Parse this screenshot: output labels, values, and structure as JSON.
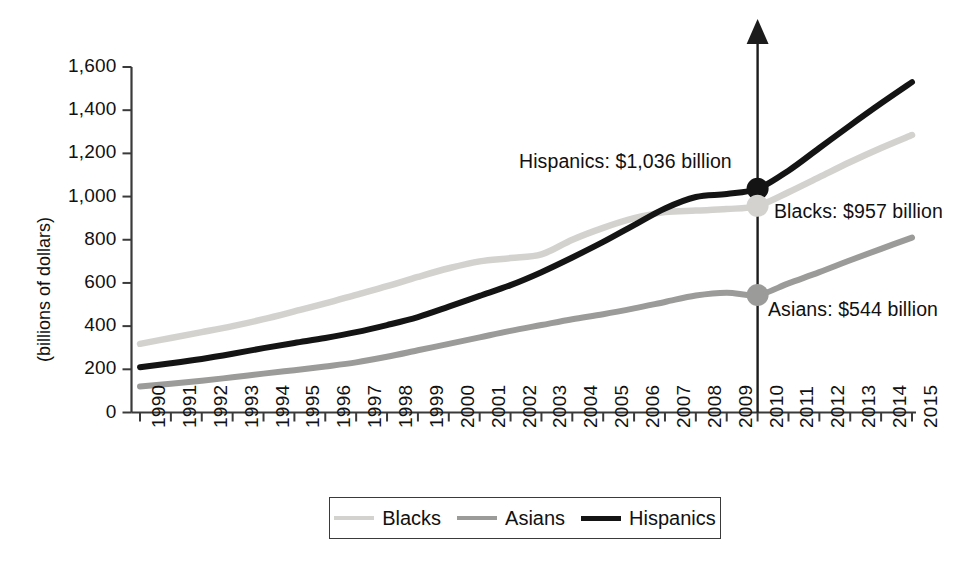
{
  "chart_data": {
    "type": "line",
    "title": "",
    "subtitle": "",
    "xlabel": "",
    "ylabel": "(billions of dollars)",
    "ylim": [
      0,
      1600
    ],
    "yticks": [
      "0",
      "200",
      "400",
      "600",
      "800",
      "1,000",
      "1,200",
      "1,400",
      "1,600"
    ],
    "ytick_values": [
      0,
      200,
      400,
      600,
      800,
      1000,
      1200,
      1400,
      1600
    ],
    "grid": false,
    "legend_position": "bottom",
    "x": [
      1990,
      1991,
      1992,
      1993,
      1994,
      1995,
      1996,
      1997,
      1998,
      1999,
      2000,
      2001,
      2002,
      2003,
      2004,
      2005,
      2006,
      2007,
      2008,
      2009,
      2010,
      2011,
      2012,
      2013,
      2014,
      2015
    ],
    "categories": [
      "1990",
      "1991",
      "1992",
      "1993",
      "1994",
      "1995",
      "1996",
      "1997",
      "1998",
      "1999",
      "2000",
      "2001",
      "2002",
      "2003",
      "2004",
      "2005",
      "2006",
      "2007",
      "2008",
      "2009",
      "2010",
      "2011",
      "2012",
      "2013",
      "2014",
      "2015"
    ],
    "series": [
      {
        "name": "Blacks",
        "color": "#d3d2ce",
        "values": [
          318,
          345,
          372,
          400,
          432,
          468,
          505,
          545,
          585,
          628,
          668,
          700,
          715,
          732,
          800,
          855,
          900,
          928,
          935,
          942,
          957,
          1020,
          1090,
          1160,
          1225,
          1285
        ]
      },
      {
        "name": "Asians",
        "color": "#9b9b99",
        "values": [
          120,
          133,
          147,
          163,
          180,
          196,
          213,
          232,
          258,
          288,
          318,
          348,
          378,
          405,
          432,
          455,
          482,
          512,
          542,
          555,
          544,
          598,
          650,
          705,
          758,
          810
        ]
      },
      {
        "name": "Hispanics",
        "color": "#141414",
        "values": [
          210,
          228,
          248,
          272,
          298,
          322,
          345,
          372,
          405,
          442,
          490,
          540,
          590,
          650,
          718,
          790,
          868,
          945,
          998,
          1012,
          1036,
          1120,
          1225,
          1330,
          1432,
          1530
        ]
      }
    ],
    "markers": [
      {
        "series": "Hispanics",
        "x": 2010,
        "y": 1036,
        "color": "#141414",
        "label": "Hispanics: $1,036 billion"
      },
      {
        "series": "Blacks",
        "x": 2010,
        "y": 957,
        "color": "#d3d2ce",
        "label": "Blacks: $957 billion"
      },
      {
        "series": "Asians",
        "x": 2010,
        "y": 544,
        "color": "#9b9b99",
        "label": "Asians: $544 billion"
      }
    ],
    "annotations": [
      {
        "text": "Hispanics: $1,036 billion"
      },
      {
        "text": "Blacks: $957 billion"
      },
      {
        "text": "Asians: $544 billion"
      }
    ],
    "callout_line": {
      "x": 2010,
      "direction": "up",
      "color": "#1c1c1c"
    }
  },
  "legend": {
    "entries": [
      {
        "label": "Blacks",
        "color": "#d3d2ce"
      },
      {
        "label": "Asians",
        "color": "#9b9b99"
      },
      {
        "label": "Hispanics",
        "color": "#141414"
      }
    ]
  }
}
